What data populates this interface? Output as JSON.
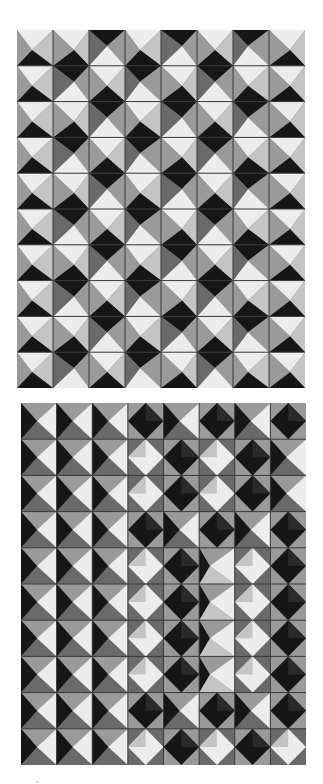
{
  "image": {
    "description": "Photograph of two tiled relief panels of folded pyramidal facets in black, white and grey",
    "background": "#ffffff"
  },
  "palette": {
    "L": "#ececec",
    "l": "#c4c4c4",
    "m": "#9a9a9a",
    "d": "#6a6a6a",
    "D": "#161616",
    "grout": "#3a3a3a"
  },
  "panels": [
    {
      "name": "top-relief-panel",
      "cols": 8,
      "rows": 10,
      "style": "square-pyramid",
      "rows_pattern": [
        [
          "U",
          "U",
          "D",
          "U",
          "D",
          "U",
          "D",
          "U"
        ],
        [
          "U",
          "D",
          "U",
          "D",
          "U",
          "D",
          "U",
          "U"
        ],
        [
          "U",
          "U",
          "D",
          "U",
          "D",
          "U",
          "D",
          "U"
        ],
        [
          "U",
          "D",
          "U",
          "D",
          "U",
          "D",
          "U",
          "U"
        ],
        [
          "U",
          "U",
          "D",
          "U",
          "D",
          "U",
          "D",
          "U"
        ],
        [
          "U",
          "D",
          "U",
          "D",
          "U",
          "D",
          "U",
          "U"
        ],
        [
          "U",
          "U",
          "D",
          "U",
          "D",
          "U",
          "D",
          "U"
        ],
        [
          "U",
          "D",
          "U",
          "D",
          "U",
          "D",
          "U",
          "U"
        ],
        [
          "U",
          "U",
          "D",
          "U",
          "D",
          "U",
          "D",
          "U"
        ],
        [
          "U",
          "D",
          "U",
          "D",
          "U",
          "D",
          "U",
          "U"
        ]
      ]
    },
    {
      "name": "bottom-relief-panel",
      "cols": 8,
      "rows": 10,
      "style": "diamond-pyramid",
      "rows_pattern": [
        [
          "R",
          "R",
          "R",
          "X",
          "R",
          "X",
          "R",
          "X"
        ],
        [
          "R",
          "R",
          "R",
          "O",
          "X",
          "O",
          "X",
          "R"
        ],
        [
          "R",
          "R",
          "R",
          "O",
          "X",
          "O",
          "X",
          "R"
        ],
        [
          "R",
          "R",
          "R",
          "X",
          "R",
          "X",
          "R",
          "X"
        ],
        [
          "R",
          "R",
          "R",
          "O",
          "X",
          "S",
          "O",
          "X"
        ],
        [
          "R",
          "R",
          "R",
          "O",
          "X",
          "S",
          "O",
          "X"
        ],
        [
          "R",
          "R",
          "R",
          "O",
          "X",
          "S",
          "O",
          "X"
        ],
        [
          "R",
          "R",
          "R",
          "O",
          "X",
          "S",
          "O",
          "X"
        ],
        [
          "R",
          "R",
          "R",
          "X",
          "R",
          "X",
          "R",
          "X"
        ],
        [
          "R",
          "R",
          "R",
          "O",
          "X",
          "O",
          "X",
          "O"
        ]
      ]
    }
  ]
}
